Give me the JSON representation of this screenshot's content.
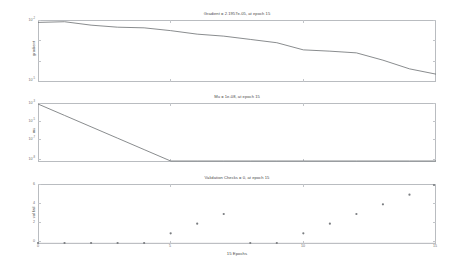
{
  "figure": {
    "background": "#ffffff",
    "line_color": "#6b6e71",
    "axis_color": "#b9bcc0",
    "width": 471,
    "height": 270
  },
  "panels": [
    {
      "name": "gradient",
      "title": "Gradient = 2.1957e-05, at epoch 15",
      "ylabel": "gradient",
      "yscale": "log",
      "ylim": [
        1e-05,
        0.01
      ],
      "ytick_labels": [
        "10",
        "10"
      ],
      "ytick_exponents": [
        "-2",
        "-5"
      ],
      "ytick_values": [
        0.01,
        1e-05
      ],
      "xlim": [
        0,
        15
      ],
      "xticks": [
        0,
        5,
        10,
        15
      ]
    },
    {
      "name": "mu",
      "title": "Mu = 1e-08, at epoch 15",
      "ylabel": "mu",
      "yscale": "log",
      "ylim": [
        1e-08,
        0.001
      ],
      "ytick_labels": [
        "10",
        "10",
        "10",
        "10"
      ],
      "ytick_exponents": [
        "-3",
        "-5",
        "-7",
        "-8"
      ],
      "ytick_values": [
        0.001,
        1e-05,
        1e-07,
        1e-08
      ],
      "xlim": [
        0,
        15
      ],
      "xticks": [
        0,
        5,
        10,
        15
      ]
    },
    {
      "name": "validation-checks",
      "title": "Validation Checks = 0, at epoch 15",
      "ylabel": "val fail",
      "yscale": "linear",
      "ylim": [
        0,
        6
      ],
      "ytick_labels": [
        "6",
        "4",
        "2",
        "0"
      ],
      "ytick_values": [
        6,
        4,
        2,
        0
      ],
      "xlim": [
        0,
        15
      ],
      "xticks": [
        0,
        5,
        10,
        15
      ]
    }
  ],
  "xlabel": "15 Epochs",
  "chart_data": [
    {
      "type": "line",
      "name": "gradient",
      "title": "Gradient = 2.1957e-05, at epoch 15",
      "xlabel": "15 Epochs",
      "ylabel": "gradient",
      "yscale": "log",
      "ylim": [
        1e-05,
        0.01
      ],
      "xlim": [
        0,
        15
      ],
      "grid": false,
      "legend": "none",
      "x": [
        0,
        1,
        2,
        3,
        4,
        5,
        6,
        7,
        8,
        9,
        10,
        11,
        12,
        13,
        14,
        15
      ],
      "values": [
        0.0085,
        0.0092,
        0.0062,
        0.0049,
        0.00455,
        0.0033,
        0.0022,
        0.00175,
        0.0012,
        0.00082,
        0.00036,
        0.00031,
        0.000255,
        0.00011,
        4.05e-05,
        2.2e-05
      ],
      "annotations": [
        "Gradient = 2.1957e-05, at epoch 15"
      ]
    },
    {
      "type": "line",
      "name": "mu",
      "title": "Mu = 1e-08, at epoch 15",
      "xlabel": "15 Epochs",
      "ylabel": "mu",
      "yscale": "log",
      "ylim": [
        1e-08,
        0.001
      ],
      "xlim": [
        0,
        15
      ],
      "grid": false,
      "legend": "none",
      "x": [
        0,
        1,
        2,
        3,
        4,
        5,
        6,
        7,
        8,
        9,
        10,
        11,
        12,
        13,
        14,
        15
      ],
      "values": [
        0.001,
        0.0001,
        1e-05,
        1e-06,
        1e-07,
        1e-08,
        1e-08,
        1e-08,
        1e-08,
        1e-08,
        1e-08,
        1e-08,
        1e-08,
        1e-08,
        1e-08,
        1e-08
      ],
      "annotations": [
        "Mu = 1e-08, at epoch 15"
      ]
    },
    {
      "type": "scatter",
      "name": "validation-checks",
      "title": "Validation Checks = 0, at epoch 15",
      "xlabel": "15 Epochs",
      "ylabel": "val fail",
      "yscale": "linear",
      "ylim": [
        0,
        6
      ],
      "xlim": [
        0,
        15
      ],
      "grid": false,
      "legend": "none",
      "x": [
        0,
        1,
        2,
        3,
        4,
        5,
        6,
        7,
        8,
        9,
        10,
        11,
        12,
        13,
        14,
        15
      ],
      "values": [
        0,
        0,
        0,
        0,
        0,
        1,
        2,
        3,
        0,
        0,
        1,
        2,
        3,
        4,
        5,
        6
      ],
      "annotations": [
        "Validation Checks = 0, at epoch 15"
      ]
    }
  ]
}
